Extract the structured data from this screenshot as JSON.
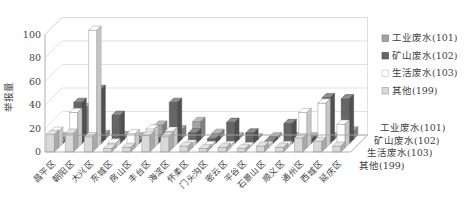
{
  "chart": {
    "y_axis_title": "举报量",
    "y_ticks": [
      0,
      20,
      40,
      60,
      80,
      100
    ],
    "colors": {
      "gridline": "#d9d9d9",
      "axis": "#a6a6a6",
      "text": "#3f3f3f",
      "background": "#ffffff"
    },
    "legend_position": "right",
    "series_axis_labels": [
      "工业废水(101)",
      "矿山废水(102)",
      "生活废水(103)",
      "其他(199)"
    ]
  },
  "chart_data": {
    "type": "bar",
    "subtype": "3d-clustered-column",
    "title": "",
    "xlabel": "",
    "ylabel": "举报量",
    "ylim": [
      0,
      100
    ],
    "grid": true,
    "legend_position": "right",
    "categories": [
      "昌平区",
      "朝阳区",
      "大兴区",
      "东城区",
      "房山区",
      "丰台区",
      "海淀区",
      "怀柔区",
      "门头沟区",
      "密云区",
      "平谷区",
      "石景山区",
      "顺义区",
      "通州区",
      "西城区",
      "延庆区"
    ],
    "series": [
      {
        "name": "工业废水(101)",
        "color": "#a3a3a3",
        "values": [
          2,
          27,
          4,
          3,
          2,
          12,
          8,
          15,
          5,
          2,
          1,
          2,
          2,
          2,
          2,
          7
        ]
      },
      {
        "name": "矿山废水(102)",
        "color": "#666666",
        "values": [
          1,
          35,
          46,
          24,
          2,
          4,
          35,
          9,
          4,
          18,
          9,
          2,
          17,
          3,
          39,
          38
        ]
      },
      {
        "name": "生活废水(103)",
        "color": "#ffffff",
        "values": [
          14,
          30,
          100,
          4,
          12,
          16,
          14,
          3,
          2,
          2,
          1,
          2,
          2,
          30,
          38,
          20
        ]
      },
      {
        "name": "其他(199)",
        "color": "#d9d9d9",
        "values": [
          15,
          16,
          13,
          3,
          4,
          14,
          13,
          5,
          3,
          4,
          3,
          5,
          4,
          12,
          9,
          5
        ]
      }
    ]
  }
}
